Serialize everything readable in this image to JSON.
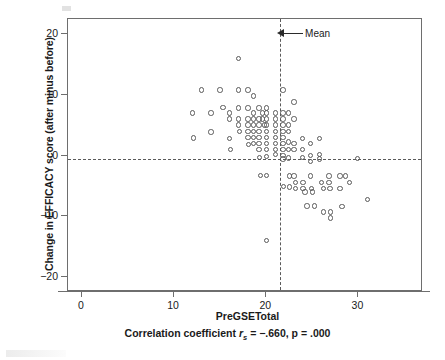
{
  "chart_data": {
    "type": "scatter",
    "title": "",
    "xlabel": "PreGSETotal",
    "ylabel": "Change in EFFICACY score (after minus before)",
    "xlim": [
      -1.5,
      37
    ],
    "ylim": [
      -22.5,
      22.5
    ],
    "xticks": [
      0,
      10,
      20,
      30
    ],
    "xticklabels": [
      "0",
      "10",
      "20",
      "30"
    ],
    "yticks": [
      20,
      10,
      0,
      -10,
      -20
    ],
    "yticklabels": [
      "20",
      "10",
      "0",
      "-10",
      "-20"
    ],
    "grid": false,
    "legend": null,
    "marker": "open-circle",
    "marker_color": "#5a5a5a",
    "annotations": [
      {
        "name": "mean-vline",
        "type": "vertical-dashed-line",
        "x": 21.5,
        "label": "Mean",
        "label_x": 23.2,
        "label_y": 20.2,
        "arrow": "left"
      },
      {
        "name": "mean-change-hline",
        "type": "horizontal-dashed-line",
        "y": -0.6,
        "label": ""
      }
    ],
    "caption": {
      "prefix": "Correlation coefficient ",
      "statistic": "r",
      "subscript": "s",
      "value_text": " = −.660, p = .000",
      "r_s": -0.66,
      "p": 0.0
    },
    "points": [
      [
        12.0,
        7.0
      ],
      [
        12.1,
        2.9
      ],
      [
        13.0,
        10.8
      ],
      [
        14.0,
        7.0
      ],
      [
        14.0,
        3.9
      ],
      [
        15.0,
        10.8
      ],
      [
        15.3,
        7.9
      ],
      [
        16.0,
        7.0
      ],
      [
        16.0,
        6.0
      ],
      [
        16.0,
        2.8
      ],
      [
        16.1,
        1.0
      ],
      [
        17.0,
        16.0
      ],
      [
        17.0,
        10.8
      ],
      [
        17.0,
        7.8
      ],
      [
        17.0,
        6.0
      ],
      [
        17.0,
        5.0
      ],
      [
        17.1,
        4.0
      ],
      [
        18.0,
        10.8
      ],
      [
        18.0,
        7.8
      ],
      [
        18.0,
        6.0
      ],
      [
        18.0,
        5.0
      ],
      [
        18.0,
        4.0
      ],
      [
        18.0,
        3.0
      ],
      [
        18.1,
        1.8
      ],
      [
        18.6,
        9.8
      ],
      [
        18.6,
        7.0
      ],
      [
        18.6,
        6.0
      ],
      [
        18.6,
        5.0
      ],
      [
        18.6,
        4.0
      ],
      [
        18.6,
        3.0
      ],
      [
        18.6,
        2.0
      ],
      [
        19.2,
        7.8
      ],
      [
        19.2,
        6.0
      ],
      [
        19.2,
        5.0
      ],
      [
        19.2,
        4.0
      ],
      [
        19.2,
        3.0
      ],
      [
        19.2,
        2.0
      ],
      [
        19.2,
        1.0
      ],
      [
        19.3,
        -0.3
      ],
      [
        19.4,
        -3.3
      ],
      [
        19.6,
        7.0
      ],
      [
        19.6,
        6.0
      ],
      [
        19.8,
        5.0
      ],
      [
        20.0,
        7.8
      ],
      [
        20.0,
        7.0
      ],
      [
        20.0,
        6.0
      ],
      [
        20.0,
        5.0
      ],
      [
        20.0,
        4.0
      ],
      [
        20.0,
        3.0
      ],
      [
        20.0,
        2.0
      ],
      [
        20.0,
        1.0
      ],
      [
        20.0,
        -0.2
      ],
      [
        20.0,
        -3.3
      ],
      [
        20.0,
        -14.0
      ],
      [
        21.0,
        7.0
      ],
      [
        21.0,
        6.0
      ],
      [
        21.0,
        5.0
      ],
      [
        21.0,
        4.0
      ],
      [
        21.0,
        3.0
      ],
      [
        21.0,
        2.0
      ],
      [
        21.0,
        1.0
      ],
      [
        21.0,
        0.2
      ],
      [
        21.8,
        10.8
      ],
      [
        21.8,
        7.0
      ],
      [
        21.8,
        6.0
      ],
      [
        21.8,
        5.0
      ],
      [
        21.8,
        4.0
      ],
      [
        21.8,
        3.0
      ],
      [
        21.8,
        2.0
      ],
      [
        21.8,
        1.0
      ],
      [
        21.8,
        0.0
      ],
      [
        21.8,
        -0.6
      ],
      [
        21.9,
        -5.1
      ],
      [
        22.4,
        7.0
      ],
      [
        22.4,
        5.0
      ],
      [
        22.4,
        4.0
      ],
      [
        22.4,
        2.2
      ],
      [
        22.4,
        1.0
      ],
      [
        22.4,
        -0.4
      ],
      [
        22.5,
        -3.4
      ],
      [
        22.5,
        -5.2
      ],
      [
        23.0,
        8.8
      ],
      [
        23.0,
        6.0
      ],
      [
        23.0,
        2.0
      ],
      [
        23.0,
        1.0
      ],
      [
        23.0,
        -3.4
      ],
      [
        23.2,
        -4.4
      ],
      [
        23.2,
        -5.4
      ],
      [
        23.9,
        2.8
      ],
      [
        23.9,
        1.0
      ],
      [
        23.9,
        -0.3
      ],
      [
        24.0,
        -4.4
      ],
      [
        24.0,
        -5.4
      ],
      [
        24.2,
        -6.0
      ],
      [
        24.4,
        -8.3
      ],
      [
        24.8,
        2.0
      ],
      [
        24.8,
        0.0
      ],
      [
        24.8,
        -1.0
      ],
      [
        24.8,
        -3.4
      ],
      [
        24.9,
        -5.4
      ],
      [
        25.0,
        -6.0
      ],
      [
        25.2,
        -8.3
      ],
      [
        25.8,
        2.8
      ],
      [
        25.8,
        0.2
      ],
      [
        25.8,
        -0.6
      ],
      [
        26.0,
        -4.4
      ],
      [
        26.2,
        -5.4
      ],
      [
        26.2,
        -9.3
      ],
      [
        26.8,
        -3.4
      ],
      [
        26.8,
        -4.4
      ],
      [
        26.9,
        -5.4
      ],
      [
        27.0,
        -9.3
      ],
      [
        27.0,
        -10.3
      ],
      [
        28.0,
        -3.4
      ],
      [
        28.0,
        -5.4
      ],
      [
        28.2,
        -8.4
      ],
      [
        28.6,
        -3.4
      ],
      [
        29.0,
        -4.4
      ],
      [
        29.9,
        -0.5
      ],
      [
        31.0,
        -7.3
      ]
    ]
  },
  "figure": {
    "axis_color": "#6e6e6e",
    "marker_edge_color": "#5a5a5a",
    "dash_color": "#5a5a5a",
    "text_color": "#1a1a1a",
    "background": "#ffffff"
  }
}
